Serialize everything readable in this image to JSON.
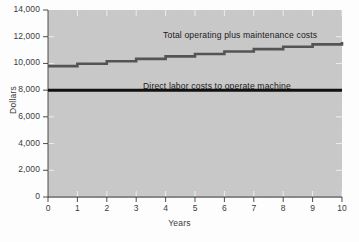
{
  "chart_data": {
    "type": "line",
    "title": "",
    "xlabel": "Years",
    "ylabel": "Dollars",
    "xlim": [
      0,
      10
    ],
    "ylim": [
      0,
      14000
    ],
    "grid": false,
    "legend_position": "inline-annotation",
    "x_ticks": [
      "0",
      "1",
      "2",
      "3",
      "4",
      "5",
      "6",
      "7",
      "8",
      "9",
      "10"
    ],
    "x_tick_values": [
      0,
      1,
      2,
      3,
      4,
      5,
      6,
      7,
      8,
      9,
      10
    ],
    "y_ticks": [
      "0",
      "2,000",
      "4,000",
      "6,000",
      "8,000",
      "10,000",
      "12,000",
      "14,000"
    ],
    "y_tick_values": [
      0,
      2000,
      4000,
      6000,
      8000,
      10000,
      12000,
      14000
    ],
    "series": [
      {
        "name": "Total operating plus maintenance costs",
        "style": "step",
        "color": "#545454",
        "x": [
          0,
          1,
          2,
          3,
          4,
          5,
          6,
          7,
          8,
          9,
          10
        ],
        "values": [
          9800,
          9980,
          10160,
          10340,
          10530,
          10710,
          10890,
          11070,
          11250,
          11430,
          11610
        ]
      },
      {
        "name": "Direct labor costs to operate machine",
        "style": "flat",
        "color": "#111111",
        "x": [
          0,
          10
        ],
        "values": [
          8000,
          8000
        ]
      }
    ],
    "annotations": [
      {
        "text": "Total operating plus  maintenance costs",
        "x": 4.0,
        "y": 12600
      },
      {
        "text": "Direct labor costs to operate machine",
        "x": 3.3,
        "y": 8800
      }
    ],
    "colors": {
      "plot_background": "#c9c9c9",
      "figure_background": "#fdfdfd",
      "axis": "#3a3a3a",
      "total_cost_line": "#545454",
      "labor_cost_line": "#111111",
      "tick_mark": "#f2f2f2"
    }
  }
}
